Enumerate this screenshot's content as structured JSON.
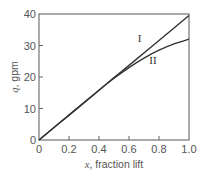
{
  "chart_data": {
    "type": "line",
    "title": "",
    "xlabel": "x, fraction lift",
    "xlabel_var": "x",
    "xlabel_text": ", fraction lift",
    "ylabel": "q, gpm",
    "ylabel_var": "q",
    "ylabel_text": ", gpm",
    "xlim": [
      0,
      1.0
    ],
    "ylim": [
      0,
      40
    ],
    "grid": false,
    "legend": "none (inline labels)",
    "x_ticks": [
      "0",
      "0.2",
      "0.4",
      "0.6",
      "0.8",
      "1.0"
    ],
    "y_ticks": [
      "0",
      "10",
      "20",
      "30",
      "40"
    ],
    "series": [
      {
        "name": "I",
        "x": [
          0,
          0.2,
          0.4,
          0.5,
          0.6,
          0.8,
          1.0
        ],
        "values": [
          0,
          7.9,
          15.8,
          19.8,
          23.7,
          31.6,
          39.5
        ]
      },
      {
        "name": "II",
        "x": [
          0,
          0.2,
          0.4,
          0.5,
          0.6,
          0.7,
          0.8,
          0.9,
          1.0
        ],
        "values": [
          0,
          7.9,
          15.8,
          19.6,
          23.0,
          26.0,
          28.5,
          30.5,
          32.0
        ]
      }
    ],
    "annotations": [
      {
        "text": "I",
        "x": 0.67,
        "y": 31
      },
      {
        "text": "II",
        "x": 0.76,
        "y": 24
      }
    ]
  },
  "colors": {
    "axis": "#666666",
    "line": "#333333",
    "text": "#555555"
  }
}
